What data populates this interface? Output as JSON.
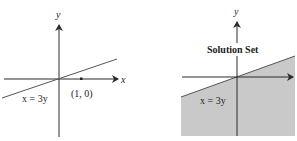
{
  "colors": {
    "axis": "#2a2a2a",
    "line": "#555555",
    "shade": "#c9c9c9",
    "background": "#ffffff"
  },
  "left_panel": {
    "x_axis_label": "x",
    "y_axis_label": "y",
    "line_label": "x = 3y",
    "point_label": "(1, 0)"
  },
  "right_panel": {
    "y_axis_label": "y",
    "region_label": "Solution Set",
    "line_label": "x = 3y"
  }
}
